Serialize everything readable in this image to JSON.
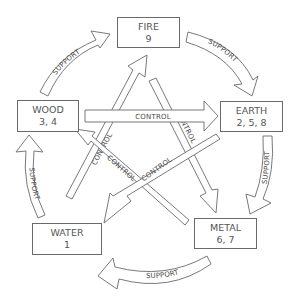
{
  "diagram": {
    "type": "five-elements-cycle",
    "nodes": [
      {
        "id": "fire",
        "name": "FIRE",
        "numbers": "9"
      },
      {
        "id": "wood",
        "name": "WOOD",
        "numbers": "3, 4"
      },
      {
        "id": "earth",
        "name": "EARTH",
        "numbers": "2, 5, 8"
      },
      {
        "id": "water",
        "name": "WATER",
        "numbers": "1"
      },
      {
        "id": "metal",
        "name": "METAL",
        "numbers": "6, 7"
      }
    ],
    "edges": {
      "wood_fire": {
        "from": "WOOD",
        "to": "FIRE",
        "label": "SUPPORT"
      },
      "fire_earth": {
        "from": "FIRE",
        "to": "EARTH",
        "label": "SUPPORT"
      },
      "earth_metal": {
        "from": "EARTH",
        "to": "METAL",
        "label": "SUPPORT"
      },
      "metal_water": {
        "from": "METAL",
        "to": "WATER",
        "label": "SUPPORT"
      },
      "water_wood": {
        "from": "WATER",
        "to": "WOOD",
        "label": "SUPPORT"
      },
      "wood_earth": {
        "from": "WOOD",
        "to": "EARTH",
        "label": "CONTROL"
      },
      "earth_water": {
        "from": "EARTH",
        "to": "WATER",
        "label": "CONTROL"
      },
      "water_fire": {
        "from": "WATER",
        "to": "FIRE",
        "label": "CONTROL"
      },
      "fire_metal": {
        "from": "FIRE",
        "to": "METAL",
        "label": "CONTROL"
      },
      "metal_wood": {
        "from": "METAL",
        "to": "WOOD",
        "label": "CONTROL"
      }
    },
    "colors": {
      "stroke": "#6a6a6a",
      "text": "#555555",
      "fill": "#ffffff"
    }
  }
}
